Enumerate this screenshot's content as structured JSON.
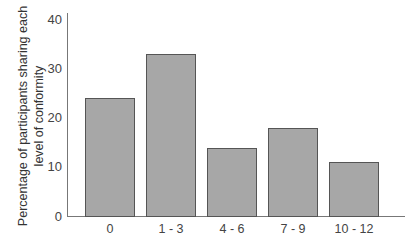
{
  "chart_data": {
    "type": "bar",
    "title": "",
    "xlabel": "",
    "ylabel": "Percentage of participants sharing each level of conformity",
    "ylabel_lines": [
      "Percentage of participants sharing each",
      "level of conformity"
    ],
    "categories": [
      "0",
      "1 - 3",
      "4 - 6",
      "7 - 9",
      "10 - 12"
    ],
    "values": [
      24,
      33,
      14,
      18,
      11
    ],
    "ylim": [
      0,
      40
    ],
    "yticks": [
      0,
      10,
      20,
      30,
      40
    ],
    "grid": false,
    "legend": null,
    "colors": {
      "bar_fill": "#a7a7a7",
      "bar_edge": "#555555",
      "axis": "#777777"
    }
  }
}
